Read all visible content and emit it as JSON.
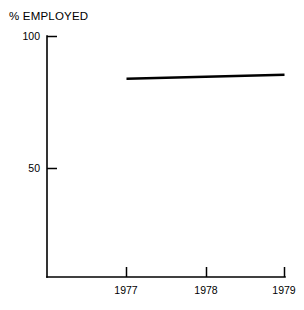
{
  "chart_data": {
    "type": "line",
    "title": "% EMPLOYED",
    "xlabel": "",
    "ylabel": "% EMPLOYED",
    "x": [
      1977,
      1979
    ],
    "series": [
      {
        "name": "% Employed",
        "values": [
          84,
          85.5
        ]
      }
    ],
    "xlim": [
      1976.0,
      1979.0
    ],
    "ylim": [
      0,
      100
    ],
    "xticks": [
      1977,
      1978,
      1979
    ],
    "xtick_labels": [
      "1977",
      "1978",
      "1979"
    ],
    "yticks": [
      50,
      100
    ],
    "ytick_labels": [
      "50",
      "100"
    ],
    "grid": false,
    "legend": "none",
    "line_color": "#000000",
    "axis_color": "#000000",
    "background_color": "#ffffff"
  },
  "axis": {
    "y_label_top": "100",
    "y_label_mid": "50",
    "x_label_1": "1977",
    "x_label_2": "1978",
    "x_label_3": "1979"
  },
  "title": {
    "text": "% EMPLOYED"
  }
}
